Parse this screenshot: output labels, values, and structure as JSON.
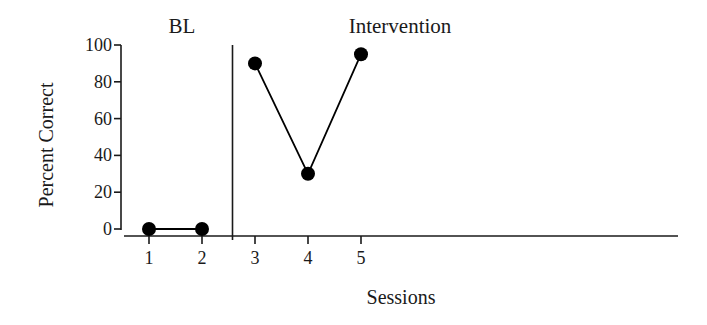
{
  "chart_data": {
    "type": "line",
    "title": "",
    "xlabel": "Sessions",
    "ylabel": "Percent Correct",
    "ylim": [
      0,
      100
    ],
    "yticks": [
      0,
      20,
      40,
      60,
      80,
      100
    ],
    "xticks": [
      1,
      2,
      3,
      4,
      5
    ],
    "grid": false,
    "legend": null,
    "phases": [
      {
        "label": "BL",
        "sessions": [
          1,
          2
        ]
      },
      {
        "label": "Intervention",
        "sessions": [
          3,
          4,
          5
        ]
      }
    ],
    "phase_change_after_session": 2,
    "series": [
      {
        "name": "BL",
        "x": [
          1,
          2
        ],
        "values": [
          0,
          0
        ]
      },
      {
        "name": "Intervention",
        "x": [
          3,
          4,
          5
        ],
        "values": [
          90,
          30,
          95
        ]
      }
    ],
    "marker": "filled-circle",
    "color": "#000000"
  },
  "labels": {
    "phase_bl": "BL",
    "phase_intervention": "Intervention",
    "xlabel": "Sessions",
    "ylabel": "Percent Correct"
  }
}
